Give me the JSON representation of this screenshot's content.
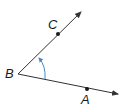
{
  "diagram": {
    "type": "angle",
    "vertex": {
      "label": "B",
      "x": 18,
      "y": 74
    },
    "rays": [
      {
        "name": "ray-BC",
        "point": {
          "label": "C",
          "x": 58,
          "y": 34
        },
        "end": {
          "x": 81,
          "y": 12
        }
      },
      {
        "name": "ray-BA",
        "point": {
          "label": "A",
          "x": 87,
          "y": 89
        },
        "end": {
          "x": 119,
          "y": 95
        }
      }
    ],
    "arc": {
      "color": "#4a86c5",
      "direction": "counterclockwise-from-BA-to-BC"
    },
    "colors": {
      "line": "#333333",
      "arc": "#4a86c5"
    }
  },
  "labels": {
    "B": "B",
    "C": "C",
    "A": "A"
  }
}
